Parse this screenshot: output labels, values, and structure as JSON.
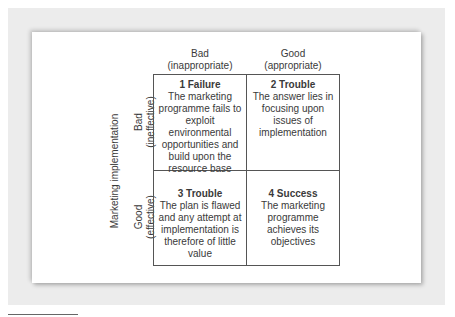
{
  "diagram": {
    "column_headers": [
      {
        "label": "Bad",
        "sub": "(inappropriate)"
      },
      {
        "label": "Good",
        "sub": "(appropriate)"
      }
    ],
    "row_axis_title": "Marketing implementation",
    "row_headers": [
      {
        "label": "Bad",
        "sub": "(ineffective)"
      },
      {
        "label": "Good",
        "sub": "(effective)"
      }
    ],
    "cells": [
      {
        "title": "1 Failure",
        "body": "The marketing programme fails to exploit environmental opportunities and build upon the resource base"
      },
      {
        "title": "2 Trouble",
        "body": "The answer lies in focusing upon issues of implementation"
      },
      {
        "title": "3 Trouble",
        "body": "The plan is flawed and any attempt at implementation is therefore of little value"
      },
      {
        "title": "4 Success",
        "body": "The marketing programme achieves its objectives"
      }
    ]
  },
  "colors": {
    "panel": "#ececec",
    "card": "#ffffff",
    "grid_line": "#555555",
    "text": "#3a3a3a"
  }
}
